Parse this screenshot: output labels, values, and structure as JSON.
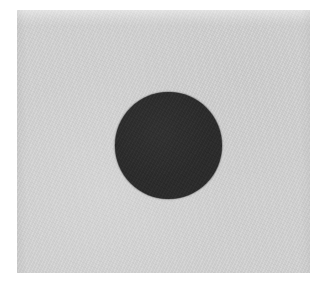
{
  "figure": {
    "caption": "",
    "background_color": "#ffffff",
    "canvas": {
      "width": 328,
      "height": 291
    },
    "panel": {
      "label": "gray background plate",
      "color": "#cdcdcd",
      "x": 17,
      "y": 10,
      "width": 293,
      "height": 263,
      "texture": "paper-grain"
    },
    "shapes": [
      {
        "name": "dark-disc",
        "type": "circle",
        "color": "#2b2b2b",
        "center_x": 168,
        "center_y": 145,
        "diameter": 107,
        "radius": 53.5,
        "fill": "solid",
        "texture": "halftone-grain"
      }
    ]
  },
  "chart_data": {
    "type": "scatter",
    "title": "",
    "xlabel": "",
    "ylabel": "",
    "grid": false,
    "legend": null,
    "xlim": [
      0,
      328
    ],
    "ylim": [
      0,
      291
    ],
    "series": [
      {
        "name": "dark-disc",
        "marker": "circle",
        "color": "#2b2b2b",
        "size": 107,
        "x": [
          168
        ],
        "y": [
          145
        ]
      }
    ],
    "annotations": []
  }
}
